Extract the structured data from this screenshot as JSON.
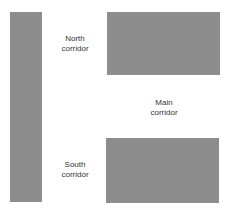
{
  "diagram": {
    "fill_color": "#8d8d8d",
    "blocks": [
      {
        "name": "left-wall"
      },
      {
        "name": "north-block"
      },
      {
        "name": "south-block"
      }
    ],
    "labels": {
      "north": {
        "line1": "North",
        "line2": "corridor"
      },
      "main": {
        "line1": "Main",
        "line2": "corridor"
      },
      "south": {
        "line1": "South",
        "line2": "corridor"
      }
    }
  }
}
